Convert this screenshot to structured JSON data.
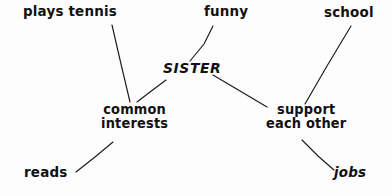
{
  "diagram": {
    "type": "hand-drawn mind map",
    "ink_color": "#111111",
    "background_color": "#fdfdfd",
    "center_node": "SISTER",
    "nodes": [
      {
        "id": "plays_tennis",
        "label": "plays tennis",
        "line1": "plays tennis",
        "line2": ""
      },
      {
        "id": "funny",
        "label": "funny",
        "line1": "funny",
        "line2": ""
      },
      {
        "id": "school",
        "label": "school",
        "line1": "school",
        "line2": ""
      },
      {
        "id": "sister",
        "label": "SISTER",
        "line1": "SISTER",
        "line2": ""
      },
      {
        "id": "common",
        "label": "common interests",
        "line1": "common",
        "line2": "interests"
      },
      {
        "id": "support",
        "label": "support each other",
        "line1": "support",
        "line2": "each other"
      },
      {
        "id": "reads",
        "label": "reads",
        "line1": "reads",
        "line2": ""
      },
      {
        "id": "jobs",
        "label": "jobs",
        "line1": "jobs",
        "line2": ""
      }
    ],
    "edges": [
      {
        "from": "sister",
        "to": "funny"
      },
      {
        "from": "sister",
        "to": "common"
      },
      {
        "from": "sister",
        "to": "support"
      },
      {
        "from": "plays_tennis",
        "to": "common"
      },
      {
        "from": "reads",
        "to": "common"
      },
      {
        "from": "school",
        "to": "support"
      },
      {
        "from": "support",
        "to": "jobs"
      }
    ]
  }
}
